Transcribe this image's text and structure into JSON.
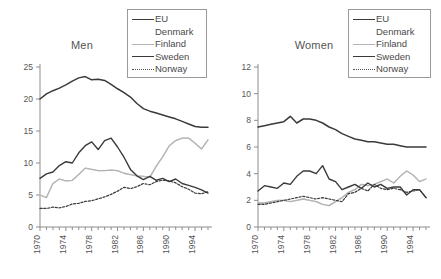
{
  "chart_data": [
    {
      "type": "line",
      "title": "Men",
      "xlabel": "",
      "ylabel": "",
      "xlim": [
        1970,
        1996
      ],
      "ylim": [
        0,
        25
      ],
      "yticks": [
        0,
        5,
        10,
        15,
        20,
        25
      ],
      "xticks": [
        1970,
        1974,
        1978,
        1982,
        1986,
        1990,
        1994
      ],
      "tick_labels_x": [
        "1970",
        "1974",
        "1978",
        "1982",
        "1986",
        "1990",
        "1994"
      ],
      "tick_labels_y": [
        "0",
        "5",
        "10",
        "15",
        "20",
        "25"
      ],
      "grid": false,
      "legend_position": "top-right",
      "x": [
        1970,
        1971,
        1972,
        1973,
        1974,
        1975,
        1976,
        1977,
        1978,
        1979,
        1980,
        1981,
        1982,
        1983,
        1984,
        1985,
        1986,
        1987,
        1988,
        1989,
        1990,
        1991,
        1992,
        1993,
        1994,
        1995,
        1996
      ],
      "series": [
        {
          "name": "EU",
          "color": "#3a3a3a",
          "style": "solid",
          "width": 1.5,
          "values": [
            20.0,
            20.8,
            21.3,
            21.7,
            22.2,
            22.8,
            23.3,
            23.5,
            23.0,
            23.1,
            22.9,
            22.3,
            21.6,
            21.0,
            20.3,
            19.3,
            18.5,
            18.1,
            17.8,
            17.5,
            17.2,
            16.9,
            16.5,
            16.1,
            15.7,
            15.6,
            15.6
          ]
        },
        {
          "name": "Denmark",
          "color": "#d8d8d8",
          "style": "solid",
          "width": 1.3,
          "values": [
            5.0,
            4.6,
            6.8,
            7.5,
            7.2,
            7.3,
            8.2,
            9.2,
            9.0,
            8.8,
            8.8,
            8.9,
            8.8,
            8.4,
            8.2,
            8.0,
            7.9,
            7.8,
            9.5,
            11.0,
            12.7,
            13.5,
            13.9,
            13.9,
            13.1,
            12.2,
            13.6
          ]
        },
        {
          "name": "Finland",
          "color": "#b3b3b3",
          "style": "solid",
          "width": 1.3,
          "values": [
            5.0,
            4.6,
            6.8,
            7.5,
            7.2,
            7.3,
            8.2,
            9.2,
            9.0,
            8.8,
            8.8,
            8.9,
            8.8,
            8.4,
            8.2,
            8.0,
            7.9,
            7.8,
            9.5,
            11.0,
            12.7,
            13.5,
            13.9,
            13.9,
            13.1,
            12.2,
            13.6
          ]
        },
        {
          "name": "Sweden",
          "color": "#3a3a3a",
          "style": "solid",
          "width": 1.4,
          "values": [
            7.6,
            8.3,
            8.6,
            9.6,
            10.2,
            10.0,
            11.6,
            12.7,
            13.3,
            12.1,
            13.5,
            13.9,
            12.5,
            10.9,
            9.0,
            8.0,
            7.4,
            7.9,
            7.3,
            7.6,
            7.1,
            7.5,
            6.8,
            6.5,
            6.2,
            5.8,
            5.3
          ]
        },
        {
          "name": "Norway",
          "color": "#3a3a3a",
          "style": "dotted",
          "width": 1.2,
          "values": [
            2.9,
            2.9,
            3.1,
            3.0,
            3.2,
            3.6,
            3.7,
            4.0,
            4.1,
            4.4,
            4.7,
            5.1,
            5.6,
            6.2,
            6.0,
            6.3,
            6.8,
            6.6,
            7.1,
            7.3,
            7.2,
            6.9,
            6.3,
            5.9,
            5.3,
            5.2,
            5.5
          ]
        }
      ]
    },
    {
      "type": "line",
      "title": "Women",
      "xlabel": "",
      "ylabel": "",
      "xlim": [
        1970,
        1996
      ],
      "ylim": [
        0,
        12
      ],
      "yticks": [
        0,
        2,
        4,
        6,
        8,
        10,
        12
      ],
      "xticks": [
        1970,
        1974,
        1978,
        1982,
        1986,
        1990,
        1994
      ],
      "tick_labels_x": [
        "1970",
        "1974",
        "1978",
        "1982",
        "1986",
        "1990",
        "1994"
      ],
      "tick_labels_y": [
        "0",
        "2",
        "4",
        "6",
        "8",
        "10",
        "12"
      ],
      "grid": false,
      "legend_position": "top-right",
      "x": [
        1970,
        1971,
        1972,
        1973,
        1974,
        1975,
        1976,
        1977,
        1978,
        1979,
        1980,
        1981,
        1982,
        1983,
        1984,
        1985,
        1986,
        1987,
        1988,
        1989,
        1990,
        1991,
        1992,
        1993,
        1994,
        1995,
        1996
      ],
      "series": [
        {
          "name": "EU",
          "color": "#3a3a3a",
          "style": "solid",
          "width": 1.5,
          "values": [
            7.5,
            7.6,
            7.7,
            7.8,
            7.9,
            8.3,
            7.8,
            8.1,
            8.1,
            8.0,
            7.8,
            7.5,
            7.3,
            7.0,
            6.8,
            6.6,
            6.5,
            6.4,
            6.4,
            6.3,
            6.2,
            6.2,
            6.1,
            6.0,
            6.0,
            6.0,
            6.0
          ]
        },
        {
          "name": "Denmark",
          "color": "#d8d8d8",
          "style": "solid",
          "width": 1.3,
          "values": [
            1.8,
            1.8,
            1.9,
            2.0,
            2.0,
            1.9,
            2.0,
            2.1,
            2.0,
            1.9,
            1.7,
            1.6,
            1.9,
            2.2,
            2.6,
            2.8,
            3.2,
            3.1,
            3.2,
            3.4,
            3.6,
            3.3,
            3.8,
            4.2,
            3.9,
            3.4,
            3.6
          ]
        },
        {
          "name": "Finland",
          "color": "#b3b3b3",
          "style": "solid",
          "width": 1.3,
          "values": [
            1.8,
            1.8,
            1.9,
            2.0,
            2.0,
            1.9,
            2.0,
            2.1,
            2.0,
            1.9,
            1.7,
            1.6,
            1.9,
            2.2,
            2.6,
            2.8,
            3.2,
            3.1,
            3.2,
            3.4,
            3.6,
            3.3,
            3.8,
            4.2,
            3.9,
            3.4,
            3.6
          ]
        },
        {
          "name": "Sweden",
          "color": "#3a3a3a",
          "style": "solid",
          "width": 1.4,
          "values": [
            2.7,
            3.1,
            3.0,
            2.9,
            3.3,
            3.2,
            3.8,
            4.2,
            4.2,
            4.0,
            4.6,
            3.6,
            3.4,
            2.8,
            3.0,
            3.2,
            2.9,
            3.3,
            3.0,
            3.2,
            2.9,
            3.0,
            3.0,
            2.4,
            2.8,
            2.8,
            2.2
          ]
        },
        {
          "name": "Norway",
          "color": "#3a3a3a",
          "style": "dotted",
          "width": 1.2,
          "values": [
            1.7,
            1.7,
            1.8,
            1.9,
            2.0,
            2.1,
            2.2,
            2.3,
            2.2,
            2.1,
            2.2,
            2.1,
            2.0,
            1.9,
            2.5,
            2.6,
            2.9,
            2.7,
            3.2,
            2.9,
            2.8,
            2.9,
            2.8,
            2.6,
            2.7,
            2.8,
            2.2
          ]
        }
      ]
    }
  ],
  "legend": {
    "entries": [
      {
        "label": "EU",
        "color": "#3a3a3a",
        "style": "solid"
      },
      {
        "label": "Denmark",
        "color": "#ffffff",
        "style": "solid"
      },
      {
        "label": "Finland",
        "color": "#b3b3b3",
        "style": "solid"
      },
      {
        "label": "Sweden",
        "color": "#3a3a3a",
        "style": "solid"
      },
      {
        "label": "Norway",
        "color": "#555555",
        "style": "dotted"
      }
    ]
  }
}
